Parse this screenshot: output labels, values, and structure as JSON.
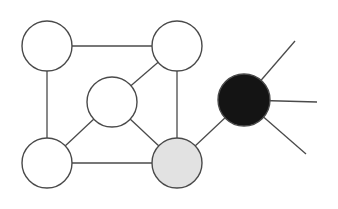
{
  "graph": {
    "colors": {
      "white": "#ffffff",
      "gray": "#e2e2e2",
      "black": "#141414",
      "stroke": "#4a4a4a"
    },
    "nodes": [
      {
        "id": "top-left",
        "cx": 47,
        "cy": 46,
        "r": 25,
        "fill": "#ffffff"
      },
      {
        "id": "top-right",
        "cx": 177,
        "cy": 46,
        "r": 25,
        "fill": "#ffffff"
      },
      {
        "id": "middle",
        "cx": 112,
        "cy": 102,
        "r": 25,
        "fill": "#ffffff"
      },
      {
        "id": "bottom-left",
        "cx": 47,
        "cy": 163,
        "r": 25,
        "fill": "#ffffff"
      },
      {
        "id": "bottom-right",
        "cx": 177,
        "cy": 163,
        "r": 25,
        "fill": "#e2e2e2"
      },
      {
        "id": "hub",
        "cx": 244,
        "cy": 100,
        "r": 26,
        "fill": "#141414"
      }
    ],
    "edges": [
      {
        "from": "top-left",
        "to": "top-right"
      },
      {
        "from": "top-left",
        "to": "bottom-left"
      },
      {
        "from": "top-right",
        "to": "middle"
      },
      {
        "from": "top-right",
        "to": "bottom-right"
      },
      {
        "from": "middle",
        "to": "bottom-left"
      },
      {
        "from": "middle",
        "to": "bottom-right"
      },
      {
        "from": "bottom-left",
        "to": "bottom-right"
      },
      {
        "from": "bottom-right",
        "to": "hub"
      }
    ],
    "spokes": [
      {
        "from": "hub",
        "x2": 295,
        "y2": 41
      },
      {
        "from": "hub",
        "x2": 317,
        "y2": 102
      },
      {
        "from": "hub",
        "x2": 306,
        "y2": 154
      }
    ]
  }
}
